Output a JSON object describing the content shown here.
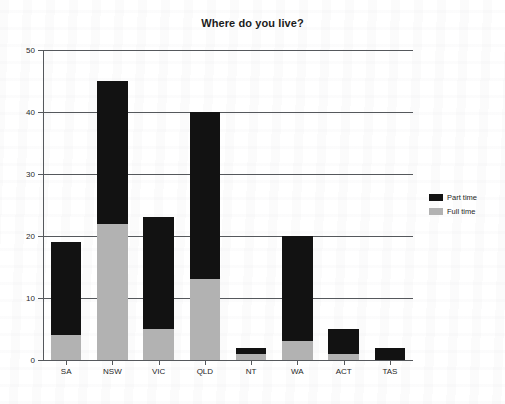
{
  "chart_data": {
    "type": "bar",
    "stacked": true,
    "title": "Where do you live?",
    "xlabel": "",
    "ylabel": "",
    "categories": [
      "SA",
      "NSW",
      "VIC",
      "QLD",
      "NT",
      "WA",
      "ACT",
      "TAS"
    ],
    "series": [
      {
        "name": "Full time",
        "color": "#b2b2b2",
        "values": [
          4,
          22,
          5,
          13,
          1,
          3,
          1,
          0
        ]
      },
      {
        "name": "Part time",
        "color": "#121212",
        "values": [
          15,
          23,
          18,
          27,
          1,
          17,
          4,
          2
        ]
      }
    ],
    "totals": [
      19,
      45,
      23,
      40,
      2,
      20,
      5,
      2
    ],
    "ylim": [
      0,
      50
    ],
    "yticks": [
      0,
      10,
      20,
      30,
      40,
      50
    ],
    "ytick_labels": [
      "0",
      "10",
      "20",
      "30",
      "40",
      "50"
    ],
    "grid": true,
    "legend_position": "right",
    "legend_entries": [
      {
        "label": "Part time",
        "color": "#121212"
      },
      {
        "label": "Full time",
        "color": "#b2b2b2"
      }
    ],
    "axis_color": "#55585c",
    "background": "#ffffff"
  }
}
